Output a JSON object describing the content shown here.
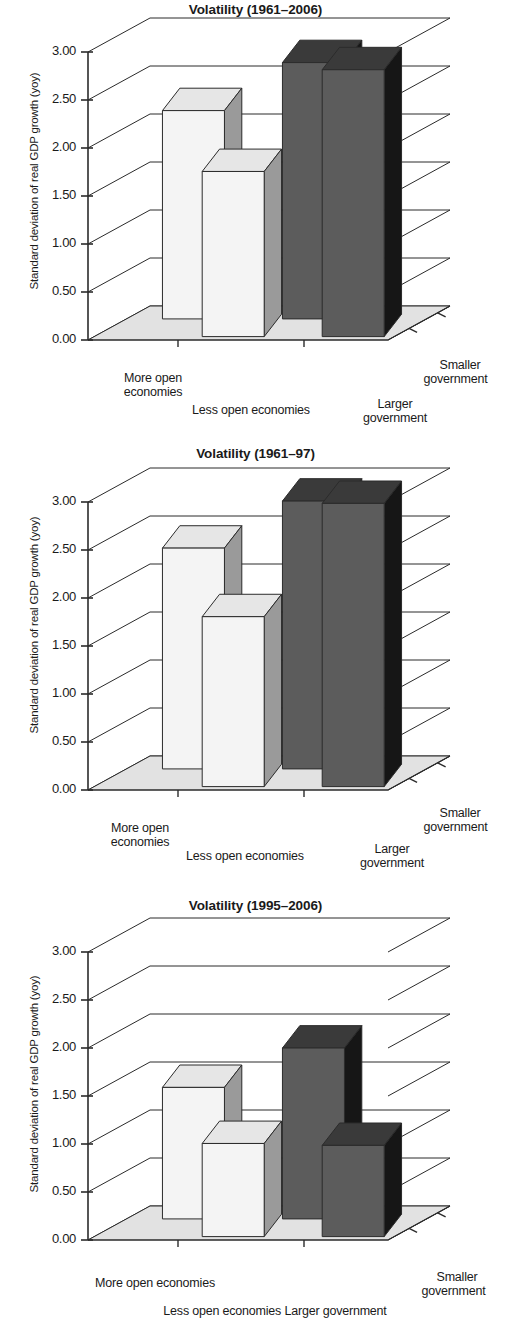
{
  "figure": {
    "ylabel": "Standard deviation of real GDP growth (yoy)",
    "y_ticks": [
      "3.00",
      "2.50",
      "2.00",
      "1.50",
      "1.00",
      "0.50",
      "0.00"
    ],
    "colors": {
      "light_front": "#f4f4f4",
      "light_side": "#9a9a9a",
      "light_top": "#e6e6e6",
      "dark_front": "#5c5c5c",
      "dark_side": "#161616",
      "dark_top": "#3a3a3a",
      "floor": "#e2e2e2",
      "line": "#2b2b2b",
      "text": "#1a1a1a"
    }
  },
  "charts": [
    {
      "id": "chart-1961-2006",
      "title": "Volatility (1961–2006)",
      "labels": {
        "more_open": "More open",
        "more_open_2": "economies",
        "less_open": "Less open economies",
        "larger_gov": "Larger",
        "larger_gov_2": "government",
        "smaller_gov": "Smaller",
        "smaller_gov_2": "government"
      }
    },
    {
      "id": "chart-1961-97",
      "title": "Volatility (1961–97)",
      "labels": {
        "more_open": "More open",
        "more_open_2": "economies",
        "less_open": "Less open economies",
        "larger_gov": "Larger",
        "larger_gov_2": "government",
        "smaller_gov": "Smaller",
        "smaller_gov_2": "government"
      }
    },
    {
      "id": "chart-1995-2006",
      "title": "Volatility (1995–2006)",
      "labels": {
        "more_open": "More open economies",
        "more_open_2": "",
        "less_open": "Less open economies Larger government",
        "larger_gov": "",
        "larger_gov_2": "",
        "smaller_gov": "Smaller",
        "smaller_gov_2": "government"
      }
    }
  ],
  "chart_data": [
    {
      "type": "bar",
      "title": "Volatility (1961–2006)",
      "xlabel": "",
      "ylabel": "Standard deviation of real GDP growth (yoy)",
      "ylim": [
        0,
        3
      ],
      "yticks": [
        0,
        0.5,
        1,
        1.5,
        2,
        2.5,
        3
      ],
      "grid": true,
      "legend": "none",
      "projection": "3d",
      "categories": [
        "More open economies",
        "Less open economies"
      ],
      "depth_categories": [
        "Larger government",
        "Smaller government"
      ],
      "series": [
        {
          "name": "Larger government",
          "values": [
            2.17,
            1.72
          ]
        },
        {
          "name": "Smaller government",
          "values": [
            2.67,
            2.78
          ]
        }
      ],
      "bars": [
        {
          "x": "More open economies",
          "z": "Larger government",
          "value": 2.17,
          "shade": "light"
        },
        {
          "x": "Less open economies",
          "z": "Larger government",
          "value": 1.72,
          "shade": "light"
        },
        {
          "x": "More open economies",
          "z": "Smaller government",
          "value": 2.67,
          "shade": "dark"
        },
        {
          "x": "Less open economies",
          "z": "Smaller government",
          "value": 2.78,
          "shade": "dark"
        }
      ]
    },
    {
      "type": "bar",
      "title": "Volatility (1961–97)",
      "xlabel": "",
      "ylabel": "Standard deviation of real GDP growth (yoy)",
      "ylim": [
        0,
        3
      ],
      "yticks": [
        0,
        0.5,
        1,
        1.5,
        2,
        2.5,
        3
      ],
      "grid": true,
      "legend": "none",
      "projection": "3d",
      "categories": [
        "More open economies",
        "Less open economies"
      ],
      "depth_categories": [
        "Larger government",
        "Smaller government"
      ],
      "series": [
        {
          "name": "Larger government",
          "values": [
            2.3,
            1.77
          ]
        },
        {
          "name": "Smaller government",
          "values": [
            2.79,
            2.95
          ]
        }
      ],
      "bars": [
        {
          "x": "More open economies",
          "z": "Larger government",
          "value": 2.3,
          "shade": "light"
        },
        {
          "x": "Less open economies",
          "z": "Larger government",
          "value": 1.77,
          "shade": "light"
        },
        {
          "x": "More open economies",
          "z": "Smaller government",
          "value": 2.79,
          "shade": "dark"
        },
        {
          "x": "Less open economies",
          "z": "Smaller government",
          "value": 2.95,
          "shade": "dark"
        }
      ]
    },
    {
      "type": "bar",
      "title": "Volatility (1995–2006)",
      "xlabel": "",
      "ylabel": "Standard deviation of real GDP growth (yoy)",
      "ylim": [
        0,
        3
      ],
      "yticks": [
        0,
        0.5,
        1,
        1.5,
        2,
        2.5,
        3
      ],
      "grid": true,
      "legend": "none",
      "projection": "3d",
      "categories": [
        "More open economies",
        "Less open economies"
      ],
      "depth_categories": [
        "Larger government",
        "Smaller government"
      ],
      "series": [
        {
          "name": "Larger government",
          "values": [
            1.37,
            0.97
          ]
        },
        {
          "name": "Smaller government",
          "values": [
            1.78,
            0.95
          ]
        }
      ],
      "bars": [
        {
          "x": "More open economies",
          "z": "Larger government",
          "value": 1.37,
          "shade": "light"
        },
        {
          "x": "Less open economies",
          "z": "Larger government",
          "value": 0.97,
          "shade": "light"
        },
        {
          "x": "More open economies",
          "z": "Smaller government",
          "value": 1.78,
          "shade": "dark"
        },
        {
          "x": "Less open economies",
          "z": "Smaller government",
          "value": 0.95,
          "shade": "dark"
        }
      ]
    }
  ]
}
